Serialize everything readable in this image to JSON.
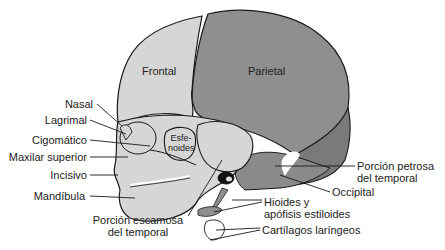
{
  "figure": {
    "colors": {
      "background": "#ffffff",
      "light_bone": "#d6d6d6",
      "dark_bone": "#8f8f8f",
      "medium_bone": "#7a7a7a",
      "outline": "#1a1a1a",
      "text": "#222222"
    },
    "regions": {
      "frontal": "Frontal",
      "parietal": "Parietal",
      "esfenoides": "Esfe-\nnoides",
      "esfenoides_line1": "Esfe-",
      "esfenoides_line2": "noides"
    },
    "labels_left": [
      {
        "id": "nasal",
        "text": "Nasal"
      },
      {
        "id": "lagrimal",
        "text": "Lagrimal"
      },
      {
        "id": "cigomatico",
        "text": "Cigomático"
      },
      {
        "id": "maxilar-superior",
        "text": "Maxilar superior"
      },
      {
        "id": "incisivo",
        "text": "Incisivo"
      },
      {
        "id": "mandibula",
        "text": "Mandíbula"
      }
    ],
    "labels_bottom": [
      {
        "id": "porcion-escamosa",
        "line1": "Porción escamosa",
        "line2": "del temporal"
      }
    ],
    "labels_right": [
      {
        "id": "porcion-petrosa",
        "line1": "Porción petrosa",
        "line2": "del temporal"
      },
      {
        "id": "occipital",
        "text": "Occipital"
      },
      {
        "id": "hioides",
        "line1": "Hioides y",
        "line2": "apófisis estiloides"
      },
      {
        "id": "cartilagos",
        "text": "Cartílagos laríngeos"
      }
    ]
  }
}
